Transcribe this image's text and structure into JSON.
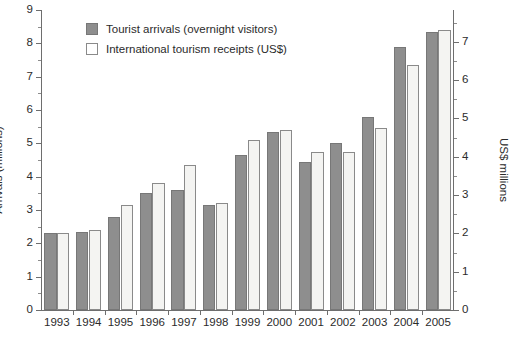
{
  "chart_data": {
    "type": "bar",
    "title": "",
    "subtitle": "",
    "xlabel": "",
    "ylabel": "Arrivals (millions)",
    "y2label": "US$ millions",
    "grid": false,
    "legend_position": "top-left-inside",
    "categories": [
      "1993",
      "1994",
      "1995",
      "1996",
      "1997",
      "1998",
      "1999",
      "2000",
      "2001",
      "2002",
      "2003",
      "2004",
      "2005"
    ],
    "ylim": [
      0,
      9
    ],
    "y2lim": [
      0,
      7.83
    ],
    "yticks": [
      0,
      1,
      2,
      3,
      4,
      5,
      6,
      7,
      8,
      9
    ],
    "ytick_labels": [
      "0",
      "1",
      "2",
      "3",
      "4",
      "5",
      "6",
      "7",
      "8",
      "9"
    ],
    "y2ticks": [
      0,
      1,
      2,
      3,
      4,
      5,
      6,
      7
    ],
    "y2tick_labels": [
      "0",
      "1",
      "2",
      "3",
      "4",
      "5",
      "6",
      "7"
    ],
    "series": [
      {
        "name": "Tourist arrivals (overnight visitors)",
        "axis": "left",
        "units": "millions",
        "color": "#8e8e8e",
        "values": [
          2.3,
          2.35,
          2.8,
          3.5,
          3.6,
          3.15,
          4.65,
          5.35,
          4.45,
          5.0,
          5.8,
          7.9,
          8.35
        ]
      },
      {
        "name": "International tourism receipts (US$)",
        "axis": "right",
        "units": "US$ millions",
        "color": "#f4f4f2",
        "values_left_scale": [
          2.32,
          2.4,
          3.15,
          3.8,
          4.35,
          3.2,
          5.1,
          5.4,
          4.75,
          4.75,
          5.45,
          7.35,
          8.4
        ],
        "values": [
          2.02,
          2.09,
          2.74,
          3.31,
          3.79,
          2.79,
          4.44,
          4.7,
          4.14,
          4.14,
          4.75,
          6.4,
          7.31
        ]
      }
    ]
  },
  "legend": {
    "items": [
      {
        "label": "Tourist arrivals (overnight visitors)",
        "swatch": "filled-gray-square"
      },
      {
        "label": "International tourism receipts (US$)",
        "swatch": "outlined-white-square"
      }
    ]
  },
  "colors": {
    "arrivals_fill": "#8e8e8e",
    "arrivals_edge": "#777777",
    "receipts_fill": "#f4f4f2",
    "receipts_edge": "#8a8a8a",
    "axis": "#6e6e6e",
    "text": "#2b2b2b",
    "background": "#ffffff"
  }
}
